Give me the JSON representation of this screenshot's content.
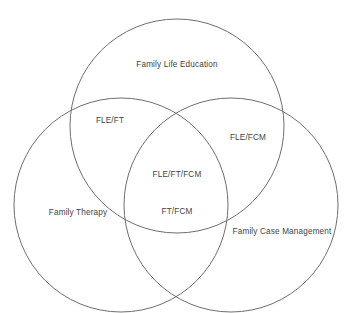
{
  "diagram": {
    "type": "venn",
    "set_count": 3,
    "stroke_color": "#6e6e6e",
    "stroke_width": 1,
    "text_color": "#434343",
    "background_color": "#ffffff",
    "circles": [
      {
        "id": "fle",
        "label": "Family Life Education",
        "cx": 177,
        "cy": 126,
        "r": 107
      },
      {
        "id": "ft",
        "label": "Family Therapy",
        "cx": 121,
        "cy": 205,
        "r": 107
      },
      {
        "id": "fcm",
        "label": "Family Case Management",
        "cx": 231,
        "cy": 205,
        "r": 107
      }
    ],
    "labels": [
      {
        "id": "fle",
        "text": "Family Life Education",
        "x": 177,
        "y": 65,
        "region": "set-only"
      },
      {
        "id": "fle-ft",
        "text": "FLE/FT",
        "x": 110,
        "y": 121,
        "region": "intersection-2"
      },
      {
        "id": "fle-fcm",
        "text": "FLE/FCM",
        "x": 248,
        "y": 138,
        "region": "intersection-2"
      },
      {
        "id": "fle-ft-fcm",
        "text": "FLE/FT/FCM",
        "x": 177,
        "y": 175,
        "region": "intersection-3"
      },
      {
        "id": "ft",
        "text": "Family Therapy",
        "x": 78,
        "y": 213,
        "region": "set-only"
      },
      {
        "id": "ft-fcm",
        "text": "FT/FCM",
        "x": 177,
        "y": 212,
        "region": "intersection-2"
      },
      {
        "id": "fcm",
        "text": "Family Case Management",
        "x": 282,
        "y": 232,
        "region": "set-only"
      }
    ]
  }
}
